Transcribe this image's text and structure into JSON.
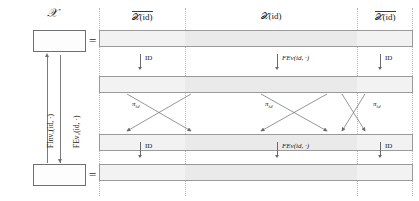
{
  "figure": {
    "kind": "commutative-diagram",
    "left": {
      "top_label": "𝒳",
      "equals_top": "=",
      "equals_bottom": "=",
      "up_arrow_label": "FInvᵤ(id, ·)",
      "down_arrow_label": "FEvᵤ(id, ·)",
      "box_top_name": "state-box-top",
      "box_bottom_name": "state-box-bottom"
    },
    "columns": [
      {
        "label": "𝒳(id)",
        "overline": true,
        "x": 0,
        "width": 86
      },
      {
        "label": "𝒳(id)",
        "overline": false,
        "x": 86,
        "width": 172
      },
      {
        "label": "𝒳(id)",
        "overline": true,
        "x": 258,
        "width": 56
      }
    ],
    "bars": [
      {
        "name": "register-row-1",
        "y": 30
      },
      {
        "name": "register-row-2",
        "y": 76
      },
      {
        "name": "register-row-3",
        "y": 134
      },
      {
        "name": "register-row-4",
        "y": 164
      }
    ],
    "arrow_rows": [
      {
        "name": "arrow-row-top",
        "y": 52,
        "arrows": [
          {
            "x": 41,
            "label": "ID",
            "label_upright": true
          },
          {
            "x": 178,
            "label": "FEv(id, ·)",
            "label_upright": false
          },
          {
            "x": 281,
            "label": "ID",
            "label_upright": true
          }
        ]
      },
      {
        "name": "arrow-row-bottom",
        "y": 140,
        "arrows": [
          {
            "x": 41,
            "label": "ID",
            "label_upright": true
          },
          {
            "x": 178,
            "label": "FEv(id, ·)",
            "label_upright": false
          },
          {
            "x": 281,
            "label": "ID",
            "label_upright": true
          }
        ]
      }
    ],
    "permutation_region": {
      "name": "permutation-crossings",
      "top_y": 94,
      "bottom_y": 132,
      "labels": [
        {
          "text": "π",
          "sub": "id",
          "x": 33,
          "y": 103
        },
        {
          "text": "π",
          "sub": "id",
          "x": 166,
          "y": 103
        },
        {
          "text": "π",
          "sub": "id",
          "x": 272,
          "y": 103
        }
      ],
      "crossings": [
        {
          "from_x": 28,
          "to_x": 92
        },
        {
          "from_x": 92,
          "to_x": 28
        },
        {
          "from_x": 162,
          "to_x": 228
        },
        {
          "from_x": 228,
          "to_x": 162
        },
        {
          "from_x": 243,
          "to_x": 266
        },
        {
          "from_x": 266,
          "to_x": 243
        }
      ]
    },
    "colors": {
      "bar_fill_outer": "#f2f2f2",
      "bar_fill_mid": "#eaeaea",
      "bar_stroke": "#9a9a9a",
      "arrow_stroke": "#6a6a6a",
      "divider_stroke": "#b9b9b9",
      "text": "#1a1a1a"
    }
  }
}
